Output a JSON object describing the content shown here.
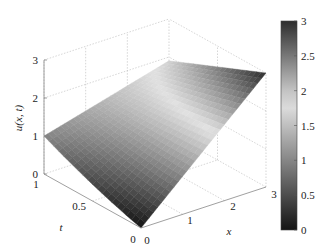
{
  "chart_data": {
    "type": "surface",
    "title": "",
    "xlabel": "x",
    "ylabel": "t",
    "zlabel": "u(x, t)",
    "x_ticks": [
      "0",
      "1",
      "2",
      "3"
    ],
    "t_ticks": [
      "0",
      "0.5",
      "1"
    ],
    "z_ticks": [
      "0",
      "1",
      "2",
      "3"
    ],
    "xlim": [
      0,
      3
    ],
    "tlim": [
      0,
      1
    ],
    "zlim": [
      0,
      3
    ],
    "grid": true,
    "colormap": "gray-diverging (dark at 0, light near 1.8, dark at 3)",
    "colorbar": {
      "ticks": [
        "0",
        "0.5",
        "1",
        "1.5",
        "2",
        "2.5",
        "3"
      ],
      "range": [
        0,
        3
      ],
      "position": "right"
    },
    "x": [
      0,
      0.5,
      1,
      1.5,
      2,
      2.5,
      3
    ],
    "t": [
      0,
      0.25,
      0.5,
      0.75,
      1
    ],
    "u_corner_values": {
      "u(0,0)": 0,
      "u(3,0)": 3,
      "u(0,1)": 1,
      "u(3,1)": 1.9
    }
  },
  "labels": {
    "zlabel": "u(x, t)",
    "tlabel": "t",
    "xlabel": "x"
  }
}
